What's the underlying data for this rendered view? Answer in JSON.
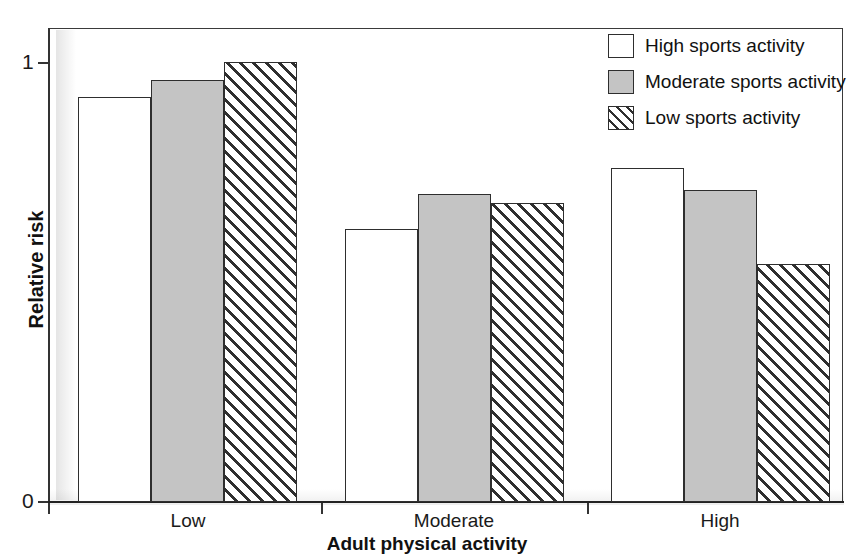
{
  "chart_data": {
    "type": "bar",
    "title": "",
    "xlabel": "Adult physical activity",
    "ylabel": "Relative risk",
    "categories": [
      "Low",
      "Moderate",
      "High"
    ],
    "ylim": [
      0,
      1.08
    ],
    "yticks": [
      0,
      1
    ],
    "ytick_labels": [
      "0",
      "1"
    ],
    "grid": false,
    "legend_position": "top-right",
    "series": [
      {
        "name": "High sports activity",
        "style": "open-white",
        "values": [
          0.92,
          0.62,
          0.76
        ]
      },
      {
        "name": "Moderate sports activity",
        "style": "solid-gray",
        "values": [
          0.96,
          0.7,
          0.71
        ]
      },
      {
        "name": "Low sports activity",
        "style": "diagonal-hatch",
        "values": [
          1.0,
          0.68,
          0.54
        ]
      }
    ]
  },
  "axes": {
    "y_title": "Relative risk",
    "x_title": "Adult physical activity",
    "y_tick_labels": [
      "1",
      "0"
    ],
    "x_tick_labels": [
      "Low",
      "Moderate",
      "High"
    ]
  },
  "legend": {
    "items": [
      {
        "label": "High sports activity",
        "swatch": "white-square-icon"
      },
      {
        "label": "Moderate sports activity",
        "swatch": "gray-square-icon"
      },
      {
        "label": "Low sports activity",
        "swatch": "hatched-square-icon"
      }
    ]
  },
  "colors": {
    "bar_outline": "#2e2e2e",
    "series_moderate_fill": "#c4c4c4",
    "series_high_fill": "#ffffff",
    "hatch_line": "#2f2f2f",
    "axis": "#333333",
    "text": "#111111"
  }
}
